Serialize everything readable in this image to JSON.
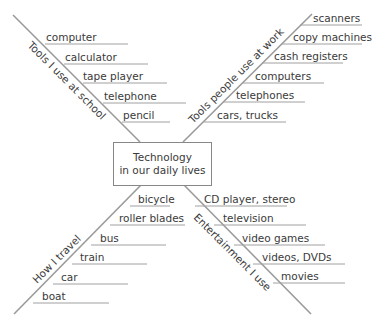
{
  "center": {
    "line1": "Technology",
    "line2": "in our daily lives"
  },
  "branches": [
    {
      "category": "Tools I use at school",
      "items": [
        "computer",
        "calculator",
        "tape player",
        "telephone",
        "pencil"
      ]
    },
    {
      "category": "Tools people use at work",
      "items": [
        "scanners",
        "copy machines",
        "cash registers",
        "computers",
        "telephones",
        "cars, trucks"
      ]
    },
    {
      "category": "How I travel",
      "items": [
        "bicycle",
        "roller blades",
        "bus",
        "train",
        "car",
        "boat"
      ]
    },
    {
      "category": "Entertainment I use",
      "items": [
        "CD player, stereo",
        "television",
        "video games",
        "videos, DVDs",
        "movies"
      ]
    }
  ]
}
